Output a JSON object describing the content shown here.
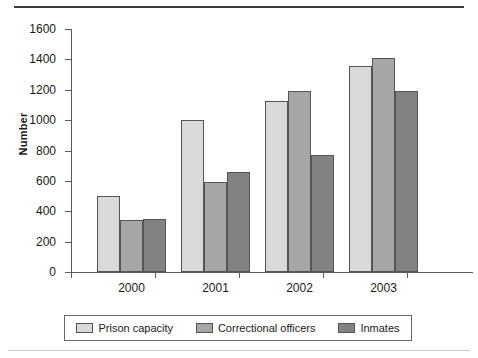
{
  "chart_data": {
    "type": "bar",
    "title": "",
    "subtitle": "",
    "xlabel": "",
    "ylabel": "Number",
    "categories": [
      "2000",
      "2001",
      "2002",
      "2003"
    ],
    "series": [
      {
        "name": "Prison capacity",
        "values": [
          500,
          1000,
          1125,
          1355
        ],
        "color": "#d9d9d9"
      },
      {
        "name": "Correctional officers",
        "values": [
          345,
          590,
          1195,
          1410
        ],
        "color": "#a6a6a6"
      },
      {
        "name": "Inmates",
        "values": [
          350,
          660,
          770,
          1190
        ],
        "color": "#828282"
      }
    ],
    "ylim": [
      0,
      1600
    ],
    "ytick_step": 200,
    "yticks": [
      0,
      200,
      400,
      600,
      800,
      1000,
      1200,
      1400,
      1600
    ],
    "ytick_labels": [
      "0",
      "200",
      "400",
      "600",
      "800",
      "1000",
      "1200",
      "1400",
      "1600"
    ],
    "grid": false,
    "legend_position": "bottom",
    "legend_entries": [
      "Prison capacity",
      "Correctional officers",
      "Inmates"
    ]
  }
}
